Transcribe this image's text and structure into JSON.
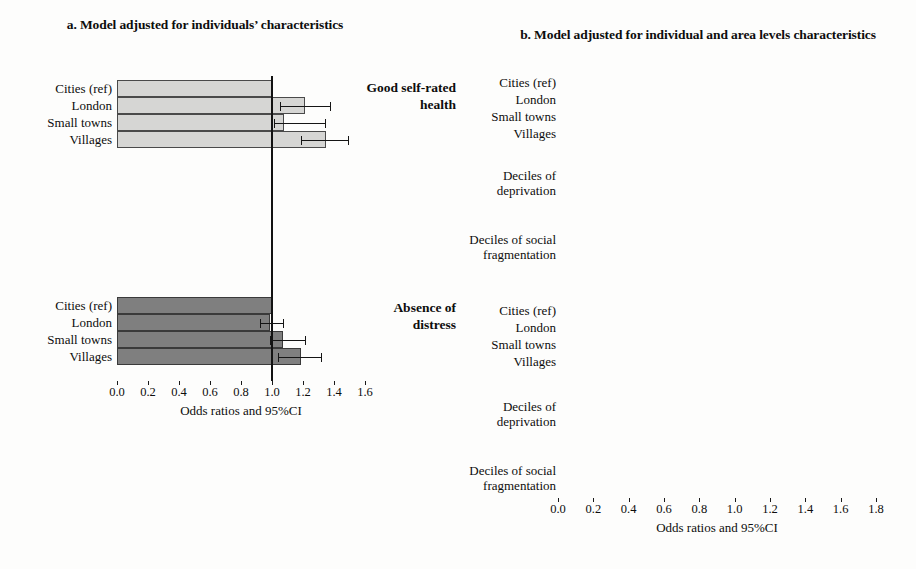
{
  "panel_a": {
    "title": "a. Model adjusted for individuals’ characteristics",
    "axis_title": "Odds ratios and 95%CI",
    "ticks": [
      "0.0",
      "0.2",
      "0.4",
      "0.6",
      "0.8",
      "1.0",
      "1.2",
      "1.4",
      "1.6"
    ]
  },
  "panel_b": {
    "title": "b. Model adjusted for individual and area levels characteristics",
    "axis_title": "Odds ratios and 95%CI",
    "ticks": [
      "0.0",
      "0.2",
      "0.4",
      "0.6",
      "0.8",
      "1.0",
      "1.2",
      "1.4",
      "1.6",
      "1.8"
    ]
  },
  "outcomes": {
    "health": "Good self-rated health",
    "distress": "Absence of distress"
  },
  "group_labels": {
    "deprivation": "Deciles of deprivation",
    "fragmentation": "Deciles of social fragmentation"
  },
  "row_labels": {
    "cities": "Cities (ref)",
    "london": "London",
    "small_towns": "Small towns",
    "villages": "Villages",
    "higher": "Higher (ref)",
    "middle": "Middle",
    "lower": "Lower"
  },
  "colors": {
    "light_bar": "#d6d6d4",
    "dark_bar": "#7f7f7f",
    "reference_line": "#121212",
    "error_bar": "#151515"
  },
  "chart_data": {
    "type": "bar",
    "xlabel": "Odds ratios and 95%CI",
    "ylabel": "",
    "orientation": "horizontal",
    "reference_value": 1.0,
    "grid": false,
    "legend": "none",
    "panels": [
      {
        "id": "a",
        "title": "a. Model adjusted for individuals’ characteristics",
        "xlim": [
          0.0,
          1.6
        ],
        "xticks": [
          0.0,
          0.2,
          0.4,
          0.6,
          0.8,
          1.0,
          1.2,
          1.4,
          1.6
        ],
        "sections": [
          {
            "outcome": "Good self-rated health",
            "fill": "light",
            "groups": [
              {
                "name": "",
                "rows": [
                  {
                    "label": "Cities (ref)",
                    "value": 1.0,
                    "ci_low": null,
                    "ci_high": null,
                    "reference": true
                  },
                  {
                    "label": "London",
                    "value": 1.21,
                    "ci_low": 1.05,
                    "ci_high": 1.38
                  },
                  {
                    "label": "Small towns",
                    "value": 1.08,
                    "ci_low": 1.01,
                    "ci_high": 1.35
                  },
                  {
                    "label": "Villages",
                    "value": 1.35,
                    "ci_low": 1.19,
                    "ci_high": 1.5
                  }
                ]
              }
            ]
          },
          {
            "outcome": "Absence of distress",
            "fill": "dark",
            "groups": [
              {
                "name": "",
                "rows": [
                  {
                    "label": "Cities (ref)",
                    "value": 1.0,
                    "ci_low": null,
                    "ci_high": null,
                    "reference": true
                  },
                  {
                    "label": "London",
                    "value": 0.99,
                    "ci_low": 0.92,
                    "ci_high": 1.08
                  },
                  {
                    "label": "Small towns",
                    "value": 1.07,
                    "ci_low": 0.99,
                    "ci_high": 1.22
                  },
                  {
                    "label": "Villages",
                    "value": 1.19,
                    "ci_low": 1.04,
                    "ci_high": 1.32
                  }
                ]
              }
            ]
          }
        ]
      },
      {
        "id": "b",
        "title": "b. Model adjusted for individual and area levels characteristics",
        "xlim": [
          0.0,
          1.8
        ],
        "xticks": [
          0.0,
          0.2,
          0.4,
          0.6,
          0.8,
          1.0,
          1.2,
          1.4,
          1.6,
          1.8
        ],
        "sections": [
          {
            "outcome": "Good self-rated health",
            "fill": "light",
            "groups": [
              {
                "name": "",
                "rows": [
                  {
                    "label": "Cities (ref)",
                    "value": 1.0,
                    "ci_low": null,
                    "ci_high": null,
                    "reference": true
                  },
                  {
                    "label": "London",
                    "value": 1.2,
                    "ci_low": 1.06,
                    "ci_high": 1.32
                  },
                  {
                    "label": "Small towns",
                    "value": 1.03,
                    "ci_low": 0.87,
                    "ci_high": 1.12
                  },
                  {
                    "label": "Villages",
                    "value": 1.19,
                    "ci_low": 1.05,
                    "ci_high": 1.31
                  }
                ]
              },
              {
                "name": "Deciles of deprivation",
                "rows": [
                  {
                    "label": "Higher (ref)",
                    "value": 1.0,
                    "ci_low": null,
                    "ci_high": null,
                    "reference": true
                  },
                  {
                    "label": "Middle",
                    "value": 1.16,
                    "ci_low": 1.05,
                    "ci_high": 1.24
                  },
                  {
                    "label": "Lower",
                    "value": 1.54,
                    "ci_low": 1.42,
                    "ci_high": 1.62
                  }
                ]
              },
              {
                "name": "Deciles of social fragmentation",
                "rows": [
                  {
                    "label": "Higher (ref)",
                    "value": 1.0,
                    "ci_low": null,
                    "ci_high": null,
                    "reference": true
                  },
                  {
                    "label": "Middle",
                    "value": 0.99,
                    "ci_low": 0.92,
                    "ci_high": 1.05
                  },
                  {
                    "label": "Lower",
                    "value": 0.98,
                    "ci_low": 0.92,
                    "ci_high": 1.03
                  }
                ]
              }
            ]
          },
          {
            "outcome": "Absence of distress",
            "fill": "dark",
            "groups": [
              {
                "name": "",
                "rows": [
                  {
                    "label": "Cities (ref)",
                    "value": 1.0,
                    "ci_low": null,
                    "ci_high": null,
                    "reference": true
                  },
                  {
                    "label": "London",
                    "value": 1.01,
                    "ci_low": 0.93,
                    "ci_high": 1.07
                  },
                  {
                    "label": "Small towns",
                    "value": 1.01,
                    "ci_low": 0.93,
                    "ci_high": 1.11
                  },
                  {
                    "label": "Villages",
                    "value": 1.13,
                    "ci_low": 1.02,
                    "ci_high": 1.21
                  }
                ]
              },
              {
                "name": "Deciles of deprivation",
                "rows": [
                  {
                    "label": "Higher (ref)",
                    "value": 1.0,
                    "ci_low": null,
                    "ci_high": null,
                    "reference": true
                  },
                  {
                    "label": "Middle",
                    "value": 1.08,
                    "ci_low": 1.0,
                    "ci_high": 1.16
                  },
                  {
                    "label": "Lower",
                    "value": 1.17,
                    "ci_low": 1.04,
                    "ci_high": 1.24
                  }
                ]
              },
              {
                "name": "Deciles of social fragmentation",
                "rows": [
                  {
                    "label": "Higher (ref)",
                    "value": 1.0,
                    "ci_low": null,
                    "ci_high": null,
                    "reference": true
                  },
                  {
                    "label": "Middle",
                    "value": 1.0,
                    "ci_low": 0.92,
                    "ci_high": 1.08
                  },
                  {
                    "label": "Lower",
                    "value": 0.99,
                    "ci_low": 0.92,
                    "ci_high": 1.06
                  }
                ]
              }
            ]
          }
        ]
      }
    ]
  }
}
